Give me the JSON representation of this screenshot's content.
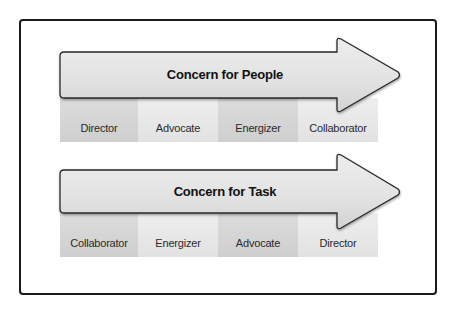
{
  "diagram": {
    "colors": {
      "frame_border": "#1a1a1a",
      "arrow_fill_top": "#ebebeb",
      "arrow_fill_bottom": "#d6d6d6",
      "arrow_stroke": "#2a2a2a",
      "cell_dark": "#d4d4d4",
      "cell_light": "#e8e8e8",
      "text": "#111111"
    },
    "rows": [
      {
        "arrow_label": "Concern for People",
        "cells": [
          {
            "label": "Director",
            "shade": "dark"
          },
          {
            "label": "Advocate",
            "shade": "light"
          },
          {
            "label": "Energizer",
            "shade": "dark"
          },
          {
            "label": "Collaborator",
            "shade": "light"
          }
        ]
      },
      {
        "arrow_label": "Concern for Task",
        "cells": [
          {
            "label": "Collaborator",
            "shade": "dark"
          },
          {
            "label": "Energizer",
            "shade": "light"
          },
          {
            "label": "Advocate",
            "shade": "dark"
          },
          {
            "label": "Director",
            "shade": "light"
          }
        ]
      }
    ]
  }
}
